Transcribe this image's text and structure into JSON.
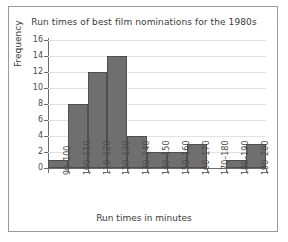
{
  "chart_data": {
    "type": "bar",
    "title": "Run times of best film nominations for the 1980s",
    "xlabel": "Run times in minutes",
    "ylabel": "Frequency",
    "categories": [
      "90–100",
      "100–110",
      "110–120",
      "120–130",
      "130–140",
      "140–150",
      "150–160",
      "160–170",
      "170–180",
      "180–190",
      "190–200"
    ],
    "values": [
      1,
      8,
      12,
      14,
      4,
      2,
      2,
      3,
      0,
      1,
      3
    ],
    "ylim": [
      0,
      16
    ],
    "ytick_labels": [
      "0",
      "2",
      "4",
      "6",
      "8",
      "10",
      "12",
      "14",
      "16"
    ],
    "ytick_values": [
      0,
      2,
      4,
      6,
      8,
      10,
      12,
      14,
      16
    ],
    "grid": "horizontal",
    "legend": "none",
    "bar_color": "#6f6f6f",
    "bar_edge_color": "#4f4f4f",
    "grid_color": "#e2e2e2",
    "axis_color": "#6b6b6b",
    "text_color": "#3a3a3a",
    "frame_color": "#9a9a9a",
    "background": "#ffffff"
  }
}
